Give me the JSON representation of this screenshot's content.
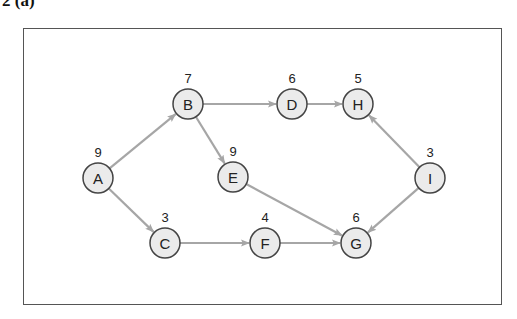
{
  "caption": "2  (a)",
  "colors": {
    "edge": "#a6a6a6",
    "node_fill": "#ebebeb",
    "node_stroke": "#444444",
    "frame": "#555555"
  },
  "nodes": [
    {
      "id": "A",
      "label": "A",
      "value": "9",
      "x": 98,
      "y": 178
    },
    {
      "id": "B",
      "label": "B",
      "value": "7",
      "x": 188,
      "y": 104
    },
    {
      "id": "C",
      "label": "C",
      "value": "3",
      "x": 165,
      "y": 243
    },
    {
      "id": "D",
      "label": "D",
      "value": "6",
      "x": 292,
      "y": 104
    },
    {
      "id": "E",
      "label": "E",
      "value": "9",
      "x": 233,
      "y": 177
    },
    {
      "id": "F",
      "label": "F",
      "value": "4",
      "x": 265,
      "y": 243
    },
    {
      "id": "G",
      "label": "G",
      "value": "6",
      "x": 356,
      "y": 243
    },
    {
      "id": "H",
      "label": "H",
      "value": "5",
      "x": 358,
      "y": 104
    },
    {
      "id": "I",
      "label": "I",
      "value": "3",
      "x": 430,
      "y": 178
    }
  ],
  "edges": [
    {
      "from": "A",
      "to": "B"
    },
    {
      "from": "A",
      "to": "C"
    },
    {
      "from": "B",
      "to": "D"
    },
    {
      "from": "B",
      "to": "E"
    },
    {
      "from": "D",
      "to": "H"
    },
    {
      "from": "E",
      "to": "G"
    },
    {
      "from": "C",
      "to": "F"
    },
    {
      "from": "F",
      "to": "G"
    },
    {
      "from": "I",
      "to": "H"
    },
    {
      "from": "I",
      "to": "G"
    }
  ]
}
